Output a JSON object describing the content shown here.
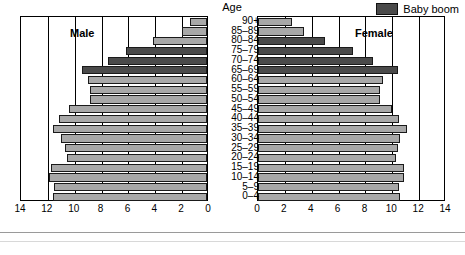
{
  "legend": {
    "swatch_color": "#4a4a4a",
    "label": "Baby boom"
  },
  "headings": {
    "age": "Age",
    "male": "Male",
    "female": "Female"
  },
  "colors": {
    "normal_bar": "#a8a8a8",
    "boom_bar": "#4a4a4a",
    "outline": "#1a1a1a",
    "axis": "#000000"
  },
  "axes": {
    "male_ticks": [
      "14",
      "12",
      "10",
      "8",
      "6",
      "4",
      "2",
      "0"
    ],
    "female_ticks": [
      "0",
      "2",
      "4",
      "6",
      "8",
      "10",
      "12",
      "14"
    ],
    "max": 14,
    "tick_step": 2
  },
  "chart_data": {
    "type": "bar",
    "title": "",
    "subtitle": "",
    "xlabel": "",
    "ylabel": "Age",
    "xlim": [
      0,
      14
    ],
    "grid": true,
    "legend_position": "top-right",
    "orientation": "horizontal-back-to-back",
    "categories": [
      "90+",
      "85–89",
      "80–84",
      "75–79",
      "70–74",
      "65–69",
      "60–64",
      "55–59",
      "50–54",
      "45–49",
      "40–44",
      "35–39",
      "30–34",
      "25–29",
      "20–24",
      "15–19",
      "10–14",
      "5–9",
      "0–4"
    ],
    "series": [
      {
        "name": "Male",
        "side": "left",
        "values": [
          1.3,
          1.9,
          4.0,
          6.0,
          7.4,
          9.3,
          8.9,
          8.7,
          8.7,
          10.3,
          11.0,
          11.5,
          10.9,
          10.6,
          10.4,
          11.6,
          11.8,
          11.4,
          11.5
        ],
        "highlight": [
          false,
          false,
          false,
          true,
          true,
          true,
          false,
          false,
          false,
          false,
          false,
          false,
          false,
          false,
          false,
          false,
          false,
          false,
          false
        ],
        "highlight_name": "Baby boom"
      },
      {
        "name": "Female",
        "side": "right",
        "values": [
          2.5,
          3.4,
          5.0,
          7.1,
          8.6,
          10.4,
          9.3,
          9.1,
          9.1,
          10.0,
          10.5,
          11.1,
          10.6,
          10.4,
          10.3,
          10.9,
          10.9,
          10.5,
          10.6
        ],
        "highlight": [
          false,
          false,
          true,
          true,
          true,
          true,
          false,
          false,
          false,
          false,
          false,
          false,
          false,
          false,
          false,
          false,
          false,
          false,
          false
        ],
        "highlight_name": "Baby boom"
      }
    ]
  }
}
